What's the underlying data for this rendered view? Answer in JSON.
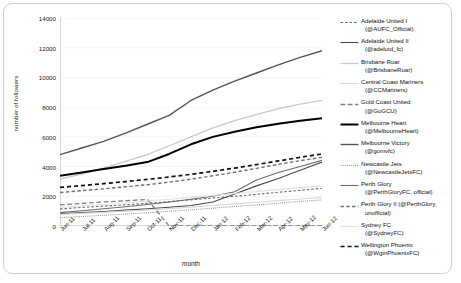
{
  "chart_data": {
    "type": "line",
    "title": "",
    "xlabel": "month",
    "ylabel": "number of followers",
    "ylim": [
      0,
      14000
    ],
    "ytick_values": [
      0,
      2000,
      4000,
      6000,
      8000,
      10000,
      12000,
      14000
    ],
    "ytick_labels": [
      "0",
      "2000",
      "4000",
      "6000",
      "8000",
      "10000",
      "12000",
      "14000"
    ],
    "grid": true,
    "legend_position": "right",
    "categories": [
      "Jun-11",
      "Jul-11",
      "Aug-11",
      "Sep-11",
      "Oct-11",
      "Nov-11",
      "Dec-11",
      "Jan-12",
      "Feb-12",
      "Mar-12",
      "Apr-12",
      "May-12",
      "Jun-12"
    ],
    "series": [
      {
        "name": "Adelaide United I (@AUFC_Official)",
        "team": "Adelaide United I",
        "handle": "(@AUFC_Official)",
        "style": "dashed",
        "color": "#6e6e6e",
        "width": 1.1,
        "values": [
          1150,
          1250,
          1340,
          1430,
          1530,
          1640,
          1760,
          1880,
          2000,
          2130,
          2270,
          2400,
          2540
        ]
      },
      {
        "name": "Adelaide United II (@adelutd_fc)",
        "team": "Adelaide United II",
        "handle": "(@adelutd_fc)",
        "style": "solid",
        "color": "#4a4a4a",
        "width": 1.1,
        "values": [
          820,
          900,
          980,
          1070,
          1160,
          1260,
          1380,
          1620,
          2150,
          2700,
          3200,
          3750,
          4300
        ]
      },
      {
        "name": "Brisbane Roar (@BrisbaneRoar)",
        "team": "Brisbane Roar",
        "handle": "(@BrisbaneRoar)",
        "style": "solid",
        "color": "#c8c8c8",
        "width": 1.3,
        "values": [
          3150,
          3500,
          3900,
          4350,
          4800,
          5400,
          6000,
          6600,
          7100,
          7500,
          7900,
          8200,
          8450
        ]
      },
      {
        "name": "Central Coast Mariners (@CCMariners)",
        "team": "Central Coast Mariners",
        "handle": "(@CCMariners)",
        "style": "solid",
        "color": "#d9d9d9",
        "width": 1.1,
        "values": [
          780,
          850,
          920,
          1000,
          1080,
          1170,
          1270,
          1380,
          1490,
          1600,
          1710,
          1820,
          1930
        ]
      },
      {
        "name": "Gold Coast United (@GoGCU)",
        "team": "Gold Coast United",
        "handle": "(@GoGCU)",
        "style": "longdash",
        "color": "#808080",
        "width": 1.3,
        "values": [
          1420,
          1520,
          1620,
          1700,
          1790,
          0,
          0,
          0,
          0,
          0,
          0,
          0,
          0
        ]
      },
      {
        "name": "Melbourne Heart (@MelbourneHeart)",
        "team": "Melbourne Heart",
        "handle": "(@MelbourneHeart)",
        "style": "solid",
        "color": "#000000",
        "width": 2.0,
        "values": [
          3380,
          3600,
          3830,
          4060,
          4300,
          4850,
          5500,
          6000,
          6350,
          6650,
          6880,
          7080,
          7250
        ]
      },
      {
        "name": "Melbourne Victory (@gomvfc)",
        "team": "Melbourne Victory",
        "handle": "(@gomvfc)",
        "style": "solid",
        "color": "#555555",
        "width": 1.4,
        "values": [
          4800,
          5250,
          5700,
          6250,
          6850,
          7450,
          8450,
          9150,
          9750,
          10300,
          10850,
          11350,
          11800
        ]
      },
      {
        "name": "Newcastle Jets (@NewcastleJetsFC)",
        "team": "Newcastle Jets",
        "handle": "(@NewcastleJetsFC)",
        "style": "dotted",
        "color": "#8a8a8a",
        "width": 1.1,
        "values": [
          560,
          640,
          720,
          800,
          890,
          990,
          1090,
          1200,
          1310,
          1420,
          1540,
          1650,
          1760
        ]
      },
      {
        "name": "Perth Glory (@PerthGloryFC, official)",
        "team": "Perth Glory",
        "handle": "(@PerthGloryFC, official)",
        "style": "solid",
        "color": "#6b6b6b",
        "width": 1.1,
        "values": [
          900,
          1030,
          1160,
          1300,
          1450,
          1620,
          1800,
          2000,
          2300,
          3100,
          3600,
          4000,
          4420
        ]
      },
      {
        "name": "Perth Glory II (@PerthGlory, unofficial)",
        "team": "Perth Glory II",
        "handle": "(@PerthGlory, unofficial)",
        "style": "dashed",
        "color": "#707070",
        "width": 1.4,
        "values": [
          2250,
          2380,
          2500,
          2640,
          2780,
          2950,
          3150,
          3380,
          3620,
          3880,
          4150,
          4400,
          4620
        ]
      },
      {
        "name": "Sydney FC (@SydneyFC)",
        "team": "Sydney FC",
        "handle": "(@SydneyFC)",
        "style": "solid",
        "color": "#e0e0e0",
        "width": 1.1,
        "values": [
          1250,
          1350,
          1450,
          1560,
          1680,
          1800,
          1930,
          2060,
          2190,
          2320,
          2450,
          2580,
          2700
        ]
      },
      {
        "name": "Wellington Phoenix (@WgtnPhoenixFC)",
        "team": "Wellington Phoenix",
        "handle": "(@WgtnPhoenixFC)",
        "style": "dashed",
        "color": "#111111",
        "width": 1.7,
        "values": [
          2600,
          2720,
          2850,
          2990,
          3140,
          3300,
          3480,
          3680,
          3900,
          4130,
          4380,
          4620,
          4850
        ]
      }
    ]
  },
  "legend": {
    "items": [
      {
        "label": "Adelaide United I",
        "sub": "(@AUFC_Official)"
      },
      {
        "label": "Adelaide United II",
        "sub": "(@adelutd_fc)"
      },
      {
        "label": "Brisbane Roar",
        "sub": "(@BrisbaneRoar)"
      },
      {
        "label": "Central Coast Mariners",
        "sub": "(@CCMariners)"
      },
      {
        "label": "Gold Coast United",
        "sub": "(@GoGCU)"
      },
      {
        "label": "Melbourne Heart",
        "sub": "(@MelbourneHeart)"
      },
      {
        "label": "Melbourne Victory",
        "sub": "(@gomvfc)"
      },
      {
        "label": "Newcastle Jets",
        "sub": "(@NewcastleJetsFC)"
      },
      {
        "label": "Perth Glory",
        "sub": "(@PerthGloryFC, official)"
      },
      {
        "label": "Perth Glory II (@PerthGlory,",
        "sub": "unofficial)"
      },
      {
        "label": "Sydney FC",
        "sub": "(@SydneyFC)"
      },
      {
        "label": "Wellington Phoenix",
        "sub": "(@WgtnPhoenixFC)"
      }
    ]
  }
}
